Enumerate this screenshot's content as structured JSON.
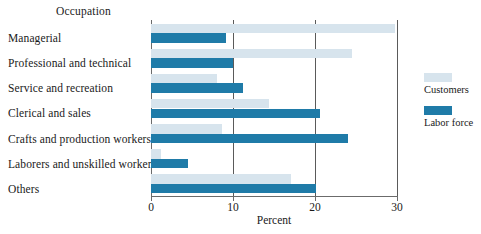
{
  "chart_data": {
    "type": "bar",
    "orientation": "horizontal",
    "title": "",
    "xlabel": "Percent",
    "ylabel": "Occupation",
    "xlim": [
      0,
      30
    ],
    "xticks": [
      0,
      10,
      20,
      30
    ],
    "grid": true,
    "legend_position": "right",
    "categories": [
      "Managerial",
      "Professional and technical",
      "Service and recreation",
      "Clerical and sales",
      "Crafts and production workers",
      "Laborers and unskilled workers",
      "Others"
    ],
    "series": [
      {
        "name": "Customers",
        "color": "#d7e4ed",
        "values": [
          29.8,
          24.5,
          8.0,
          14.4,
          8.7,
          1.2,
          17.1
        ]
      },
      {
        "name": "Labor force",
        "color": "#1f7ba8",
        "values": [
          9.2,
          10.0,
          11.2,
          20.6,
          24.0,
          4.5,
          20.1
        ]
      }
    ]
  },
  "legend": {
    "items": [
      {
        "label": "Customers"
      },
      {
        "label": "Labor force"
      }
    ]
  },
  "colors": {
    "customers": "#d7e4ed",
    "labor_force": "#1f7ba8",
    "axis": "#6b6b6b",
    "background": "#ffffff"
  }
}
